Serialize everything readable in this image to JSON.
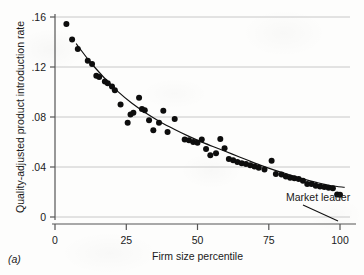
{
  "figure": {
    "panel_label": "(a)",
    "background_color": "#fdfdfc",
    "marker_color": "#0d0d0d",
    "axis_color": "#555555",
    "grid_color": "#c8c8c8",
    "fit_line_color": "#111111"
  },
  "chart_data": {
    "type": "scatter",
    "title": "",
    "subtitle": "",
    "xlabel": "Firm size percentile",
    "ylabel": "Quality-adjusted product introduction rate",
    "xlim": [
      0,
      103
    ],
    "ylim": [
      0,
      0.168
    ],
    "xticks": [
      0,
      25,
      50,
      75,
      100
    ],
    "xtick_labels": [
      "0",
      "25",
      "50",
      "75",
      "100"
    ],
    "yticks": [
      0,
      0.04,
      0.08,
      0.12,
      0.16
    ],
    "ytick_labels": [
      "0",
      ".04",
      ".08",
      ".12",
      ".16"
    ],
    "grid": "horizontal",
    "legend": "none",
    "series": [
      {
        "name": "Quality-adjusted product introduction rate",
        "marker": "filled-circle",
        "points": [
          [
            4.0,
            0.1545
          ],
          [
            6.0,
            0.142
          ],
          [
            8.0,
            0.1345
          ],
          [
            11.5,
            0.125
          ],
          [
            13.0,
            0.1225
          ],
          [
            14.5,
            0.113
          ],
          [
            15.5,
            0.112
          ],
          [
            17.5,
            0.1085
          ],
          [
            18.5,
            0.107
          ],
          [
            20.0,
            0.1045
          ],
          [
            21.0,
            0.1015
          ],
          [
            23.0,
            0.09
          ],
          [
            25.5,
            0.0755
          ],
          [
            26.5,
            0.082
          ],
          [
            27.5,
            0.0835
          ],
          [
            29.5,
            0.0955
          ],
          [
            30.5,
            0.0865
          ],
          [
            31.5,
            0.0855
          ],
          [
            33.0,
            0.0775
          ],
          [
            34.5,
            0.0695
          ],
          [
            36.5,
            0.0755
          ],
          [
            38.0,
            0.085
          ],
          [
            39.5,
            0.068
          ],
          [
            42.0,
            0.0785
          ],
          [
            45.5,
            0.062
          ],
          [
            47.0,
            0.0615
          ],
          [
            48.5,
            0.06
          ],
          [
            50.0,
            0.0595
          ],
          [
            51.5,
            0.062
          ],
          [
            53.0,
            0.0545
          ],
          [
            54.5,
            0.0495
          ],
          [
            56.5,
            0.051
          ],
          [
            58.0,
            0.0625
          ],
          [
            59.5,
            0.055
          ],
          [
            61.0,
            0.0465
          ],
          [
            62.5,
            0.0455
          ],
          [
            64.0,
            0.044
          ],
          [
            65.5,
            0.043
          ],
          [
            67.0,
            0.0425
          ],
          [
            68.5,
            0.0415
          ],
          [
            70.0,
            0.0405
          ],
          [
            71.5,
            0.0395
          ],
          [
            73.5,
            0.038
          ],
          [
            76.0,
            0.045
          ],
          [
            77.5,
            0.0345
          ],
          [
            79.5,
            0.034
          ],
          [
            81.0,
            0.0325
          ],
          [
            82.5,
            0.0315
          ],
          [
            84.0,
            0.031
          ],
          [
            85.5,
            0.0305
          ],
          [
            87.0,
            0.029
          ],
          [
            88.5,
            0.0265
          ],
          [
            90.0,
            0.0265
          ],
          [
            91.5,
            0.025
          ],
          [
            93.0,
            0.0245
          ],
          [
            94.5,
            0.024
          ],
          [
            96.0,
            0.0235
          ],
          [
            97.5,
            0.023
          ],
          [
            99.0,
            0.018
          ],
          [
            100.0,
            0.0178
          ]
        ]
      }
    ],
    "fit_line": {
      "name": "fitted curve",
      "points": [
        [
          7.5,
          0.1385
        ],
        [
          12.0,
          0.125
        ],
        [
          17.0,
          0.112
        ],
        [
          22.0,
          0.1005
        ],
        [
          27.0,
          0.091
        ],
        [
          32.0,
          0.083
        ],
        [
          37.0,
          0.076
        ],
        [
          42.0,
          0.07
        ],
        [
          47.0,
          0.0645
        ],
        [
          52.0,
          0.0595
        ],
        [
          57.0,
          0.055
        ],
        [
          62.0,
          0.0505
        ],
        [
          67.0,
          0.046
        ],
        [
          72.0,
          0.0415
        ],
        [
          77.0,
          0.0375
        ],
        [
          82.0,
          0.034
        ],
        [
          87.0,
          0.0305
        ],
        [
          92.0,
          0.0275
        ],
        [
          97.0,
          0.025
        ],
        [
          101.5,
          0.0238
        ]
      ]
    },
    "annotations": [
      {
        "id": "market-leader",
        "text": "Market leader",
        "points_to": [
          100.0,
          0.0178
        ]
      }
    ]
  }
}
